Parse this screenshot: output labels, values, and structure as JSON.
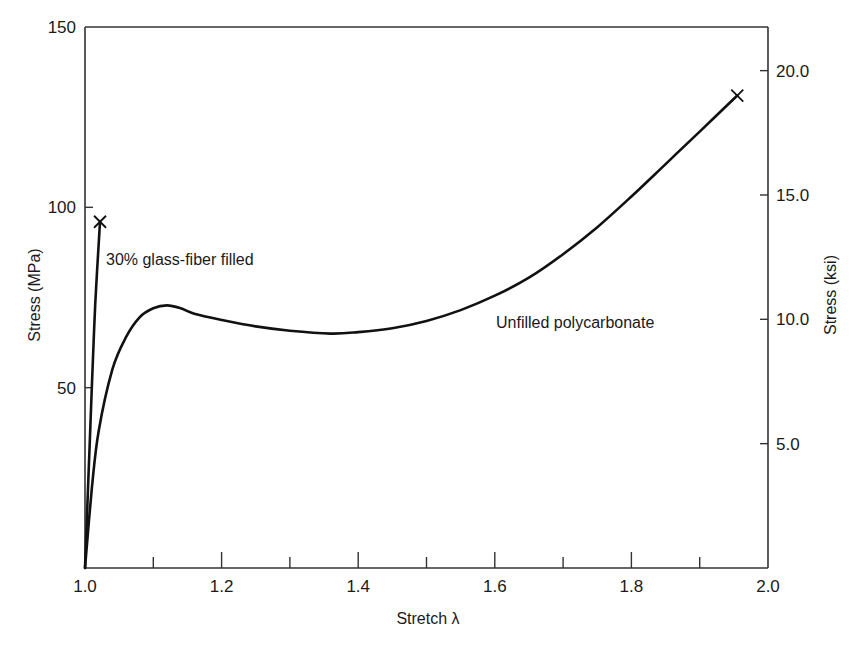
{
  "chart_data": {
    "type": "line",
    "title": "",
    "xlabel": "Stretch λ",
    "ylabel": "Stress (MPa)",
    "y2label": "Stress (ksi)",
    "xlim": [
      1.0,
      2.0
    ],
    "ylim": [
      0,
      150
    ],
    "y2lim": [
      0,
      21.76
    ],
    "grid": false,
    "legend": "none (inline annotations)",
    "x_ticks": [
      "1.0",
      "1.2",
      "1.4",
      "1.6",
      "1.8",
      "2.0"
    ],
    "x_minor_ticks": [
      1.1,
      1.3,
      1.5,
      1.7,
      1.9
    ],
    "y_ticks": [
      "50",
      "100",
      "150"
    ],
    "y2_ticks": [
      "5.0",
      "10.0",
      "15.0",
      "20.0"
    ],
    "series": [
      {
        "name": "30% glass-fiber filled",
        "x": [
          1.0,
          1.005,
          1.01,
          1.015,
          1.022
        ],
        "y": [
          0,
          25,
          50,
          73,
          96
        ],
        "failure_marker": {
          "x": 1.022,
          "y": 96,
          "symbol": "x"
        }
      },
      {
        "name": "Unfilled polycarbonate",
        "x": [
          1.0,
          1.01,
          1.02,
          1.04,
          1.06,
          1.08,
          1.1,
          1.12,
          1.14,
          1.16,
          1.2,
          1.25,
          1.3,
          1.36,
          1.4,
          1.45,
          1.5,
          1.55,
          1.6,
          1.65,
          1.7,
          1.75,
          1.8,
          1.85,
          1.9,
          1.955
        ],
        "y": [
          0,
          22,
          38,
          55,
          64,
          69.5,
          72,
          72.8,
          72,
          70.5,
          68.8,
          67,
          65.8,
          65,
          65.4,
          66.5,
          68.5,
          71.5,
          75.5,
          80.5,
          87,
          94.5,
          103,
          112,
          121,
          131
        ],
        "failure_marker": {
          "x": 1.955,
          "y": 131,
          "symbol": "x"
        }
      }
    ],
    "annotations": [
      {
        "text": "30% glass-fiber filled",
        "x": 1.03,
        "y": 85
      },
      {
        "text": "Unfilled polycarbonate",
        "x": 1.6,
        "y": 66
      }
    ]
  },
  "labels": {
    "xlabel": "Stretch λ",
    "ylabel": "Stress (MPa)",
    "y2label": "Stress (ksi)",
    "annot_glass": "30% glass-fiber filled",
    "annot_unfilled": "Unfilled polycarbonate"
  },
  "colors": {
    "line": "#111111",
    "axis": "#333333",
    "background": "#ffffff"
  }
}
